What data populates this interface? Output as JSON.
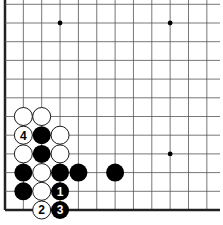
{
  "diagram": {
    "type": "go-board-fragment",
    "visible_corner": "bottom-left",
    "columns": 12,
    "rows": 12,
    "colors": {
      "background": "#ffffff",
      "grid_line": "#555555",
      "edge_line": "#222222",
      "black_stone": "#000000",
      "white_stone": "#ffffff",
      "stone_outline": "#000000"
    },
    "star_points": [
      {
        "col": 3,
        "row": 1
      },
      {
        "col": 9,
        "row": 1
      },
      {
        "col": 9,
        "row": 8
      }
    ],
    "stones": [
      {
        "color": "white",
        "col": 1,
        "row": 6,
        "label": ""
      },
      {
        "color": "white",
        "col": 2,
        "row": 6,
        "label": ""
      },
      {
        "color": "white",
        "col": 1,
        "row": 7,
        "label": "4"
      },
      {
        "color": "black",
        "col": 2,
        "row": 7,
        "label": ""
      },
      {
        "color": "white",
        "col": 3,
        "row": 7,
        "label": ""
      },
      {
        "color": "white",
        "col": 1,
        "row": 8,
        "label": ""
      },
      {
        "color": "black",
        "col": 2,
        "row": 8,
        "label": ""
      },
      {
        "color": "white",
        "col": 3,
        "row": 8,
        "label": ""
      },
      {
        "color": "black",
        "col": 1,
        "row": 9,
        "label": ""
      },
      {
        "color": "white",
        "col": 2,
        "row": 9,
        "label": ""
      },
      {
        "color": "black",
        "col": 3,
        "row": 9,
        "label": ""
      },
      {
        "color": "black",
        "col": 4,
        "row": 9,
        "label": ""
      },
      {
        "color": "black",
        "col": 6,
        "row": 9,
        "label": ""
      },
      {
        "color": "black",
        "col": 1,
        "row": 10,
        "label": ""
      },
      {
        "color": "white",
        "col": 2,
        "row": 10,
        "label": ""
      },
      {
        "color": "black",
        "col": 3,
        "row": 10,
        "label": "1"
      },
      {
        "color": "white",
        "col": 2,
        "row": 11,
        "label": "2"
      },
      {
        "color": "black",
        "col": 3,
        "row": 11,
        "label": "3"
      }
    ]
  }
}
